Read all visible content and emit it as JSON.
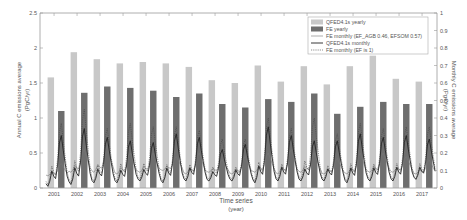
{
  "chart_data": {
    "type": "bar",
    "title": "",
    "xlabel": "Time series",
    "xlabel_sub": "(year)",
    "ylabel": "Annual C emissions average",
    "ylabel_unit": "(PgC/yr)",
    "y2label": "Monthly C emissions average",
    "y2label_unit": "(PgC/yr)",
    "ylim": [
      0,
      2.5
    ],
    "y2lim": [
      0,
      1
    ],
    "yticks": [
      "0",
      "0.5",
      "1",
      "1.5",
      "2",
      "2.5"
    ],
    "y2ticks": [
      "0",
      "0.1",
      "0.2",
      "0.3",
      "0.4",
      "0.5",
      "0.6",
      "0.7",
      "0.8",
      "0.9",
      "1"
    ],
    "categories": [
      "2001",
      "2002",
      "2003",
      "2004",
      "2005",
      "2006",
      "2007",
      "2008",
      "2009",
      "2010",
      "2011",
      "2012",
      "2013",
      "2014",
      "2015",
      "2016",
      "2017"
    ],
    "series": [
      {
        "name": "QFED4.1s yearly",
        "kind": "bar",
        "color": "#c8c8c8",
        "values": [
          1.58,
          1.94,
          1.84,
          1.78,
          1.8,
          1.78,
          1.73,
          1.54,
          1.5,
          1.75,
          1.52,
          1.74,
          1.48,
          1.74,
          1.89,
          1.56,
          1.52
        ]
      },
      {
        "name": "FE yearly",
        "kind": "bar",
        "color": "#6e6e6e",
        "values": [
          1.1,
          1.36,
          1.45,
          1.43,
          1.39,
          1.3,
          1.35,
          1.2,
          1.15,
          1.27,
          1.23,
          1.35,
          1.06,
          1.16,
          1.23,
          1.2,
          1.2
        ]
      },
      {
        "name": "FE monthly (EF_AGB 0.46, EFSOM 0.57)",
        "kind": "line",
        "style": "solid-thin",
        "color": "#777777",
        "annual_peak": [
          0.14,
          0.22,
          0.24,
          0.2,
          0.2,
          0.18,
          0.2,
          0.16,
          0.18,
          0.2,
          0.22,
          0.2,
          0.17,
          0.2,
          0.2,
          0.18,
          0.16
        ],
        "annual_min": [
          0.07,
          0.09,
          0.09,
          0.08,
          0.09,
          0.1,
          0.08,
          0.09,
          0.08,
          0.09,
          0.08,
          0.09,
          0.08,
          0.08,
          0.09,
          0.09,
          0.08
        ]
      },
      {
        "name": "QFED4.1s monthly",
        "kind": "line",
        "style": "solid",
        "color": "#222222",
        "annual_peak": [
          0.3,
          0.34,
          0.29,
          0.27,
          0.26,
          0.31,
          0.29,
          0.22,
          0.25,
          0.35,
          0.3,
          0.27,
          0.27,
          0.31,
          0.29,
          0.3,
          0.28
        ],
        "annual_min": [
          0.01,
          0.02,
          0.03,
          0.03,
          0.04,
          0.03,
          0.04,
          0.04,
          0.04,
          0.03,
          0.04,
          0.04,
          0.04,
          0.03,
          0.04,
          0.04,
          0.05
        ]
      },
      {
        "name": "FE monthly (EF is 1)",
        "kind": "line",
        "style": "dotted",
        "color": "#444444",
        "annual_peak": [
          0.37,
          0.45,
          0.34,
          0.37,
          0.35,
          0.35,
          0.33,
          0.28,
          0.28,
          0.4,
          0.34,
          0.4,
          0.31,
          0.37,
          0.34,
          0.35,
          0.35
        ],
        "annual_min": [
          0.02,
          0.03,
          0.04,
          0.04,
          0.05,
          0.04,
          0.05,
          0.05,
          0.05,
          0.04,
          0.05,
          0.05,
          0.05,
          0.04,
          0.05,
          0.05,
          0.05
        ]
      }
    ],
    "legend_position": "upper-right",
    "grid": false
  }
}
